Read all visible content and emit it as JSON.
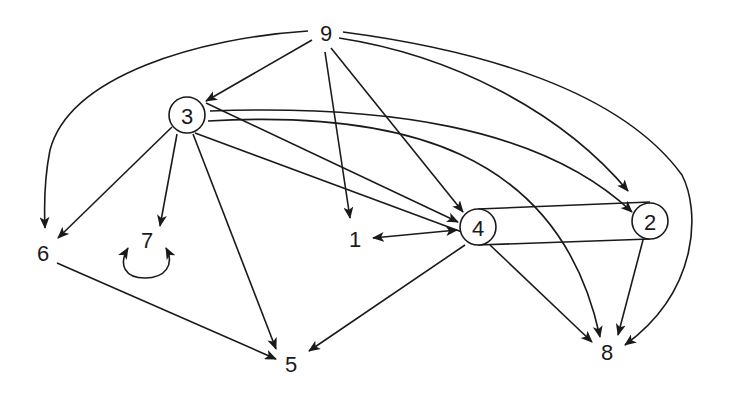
{
  "diagram": {
    "type": "directed-graph",
    "colors": {
      "stroke": "#1a1a1a",
      "background": "#ffffff"
    },
    "nodes": [
      {
        "id": "9",
        "label": "9",
        "x": 326,
        "y": 33,
        "circled": false
      },
      {
        "id": "3",
        "label": "3",
        "x": 187,
        "y": 115,
        "circled": true
      },
      {
        "id": "6",
        "label": "6",
        "x": 43,
        "y": 253,
        "circled": false
      },
      {
        "id": "7",
        "label": "7",
        "x": 147,
        "y": 240,
        "circled": false
      },
      {
        "id": "1",
        "label": "1",
        "x": 355,
        "y": 239,
        "circled": false
      },
      {
        "id": "4",
        "label": "4",
        "x": 478,
        "y": 227,
        "circled": true
      },
      {
        "id": "2",
        "label": "2",
        "x": 650,
        "y": 221,
        "circled": true
      },
      {
        "id": "5",
        "label": "5",
        "x": 291,
        "y": 364,
        "circled": false
      },
      {
        "id": "8",
        "label": "8",
        "x": 607,
        "y": 352,
        "circled": false
      }
    ],
    "edges": [
      {
        "from": "9",
        "to": "3",
        "directed": true
      },
      {
        "from": "9",
        "to": "6",
        "directed": true,
        "curved": true
      },
      {
        "from": "9",
        "to": "1",
        "directed": true
      },
      {
        "from": "9",
        "to": "4",
        "directed": true
      },
      {
        "from": "9",
        "to": "2",
        "directed": true,
        "curved": true
      },
      {
        "from": "9",
        "to": "8",
        "directed": true,
        "curved": true
      },
      {
        "from": "3",
        "to": "6",
        "directed": true
      },
      {
        "from": "3",
        "to": "7",
        "directed": true
      },
      {
        "from": "3",
        "to": "5",
        "directed": true
      },
      {
        "from": "3",
        "to": "4",
        "directed": true
      },
      {
        "from": "3",
        "to": "2",
        "directed": true,
        "curved": true
      },
      {
        "from": "3",
        "to": "8",
        "directed": true,
        "curved": true
      },
      {
        "from": "7",
        "to": "7",
        "directed": true,
        "self_loop": true
      },
      {
        "from": "4",
        "to": "1",
        "directed": true,
        "bidirectional": true
      },
      {
        "from": "4",
        "to": "2",
        "directed": false,
        "style": "double-line"
      },
      {
        "from": "4",
        "to": "5",
        "directed": true
      },
      {
        "from": "4",
        "to": "8",
        "directed": true
      },
      {
        "from": "2",
        "to": "8",
        "directed": true
      },
      {
        "from": "6",
        "to": "5",
        "directed": true
      }
    ]
  }
}
